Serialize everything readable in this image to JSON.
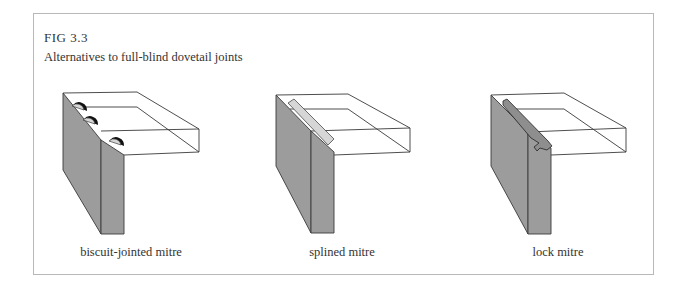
{
  "figure": {
    "label": "FIG 3.3",
    "title": "Alternatives to full-blind dovetail joints"
  },
  "panels": [
    {
      "caption": "biscuit-jointed mitre",
      "joint": "biscuit"
    },
    {
      "caption": "splined mitre",
      "joint": "spline"
    },
    {
      "caption": "lock mitre",
      "joint": "lock"
    }
  ],
  "colors": {
    "panel_gray": "#9c9c9c",
    "insert_light": "#d6d6d6",
    "line": "#3a3a3a",
    "border": "#b8b8b8"
  }
}
